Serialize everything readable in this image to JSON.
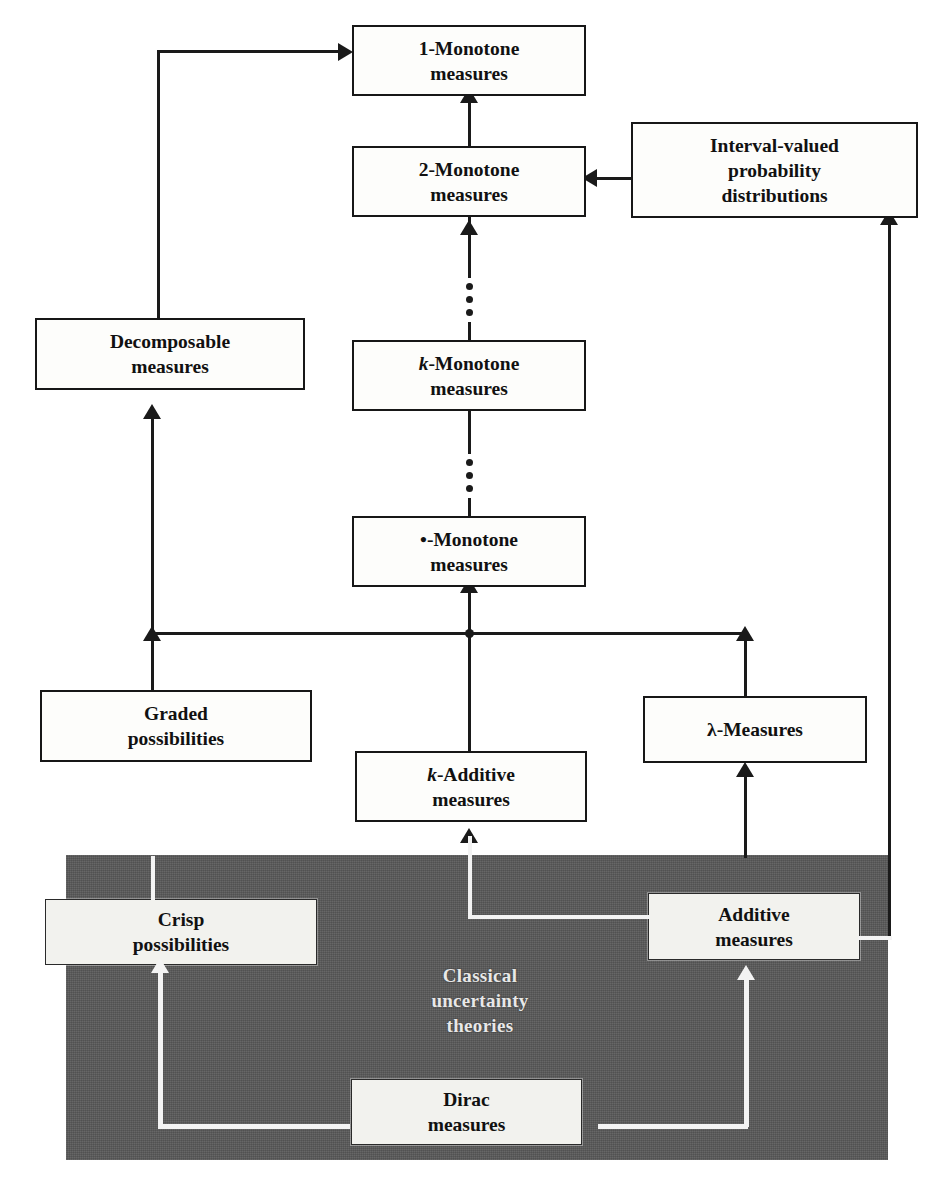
{
  "diagram": {
    "region": {
      "caption_line1": "Classical",
      "caption_line2": "uncertainty",
      "caption_line3": "theories",
      "fill_color": "#595959",
      "text_color": "#e8e8e8"
    },
    "colors": {
      "box_fill": "#fdfdfb",
      "box_border": "#171717",
      "edge": "#1a1a1a",
      "edge_inside_region": "#f3f3f3",
      "page_background": "#ffffff"
    },
    "nodes": [
      {
        "id": "one-monotone",
        "line1": "1-Monotone",
        "line2": "measures",
        "prefix_style": "normal"
      },
      {
        "id": "two-monotone",
        "line1": "2-Monotone",
        "line2": "measures",
        "prefix_style": "normal"
      },
      {
        "id": "interval-valued",
        "line1": "Interval-valued",
        "line2": "probability",
        "line3": "distributions",
        "prefix_style": "normal"
      },
      {
        "id": "decomposable",
        "line1": "Decomposable",
        "line2": "measures",
        "prefix_style": "normal"
      },
      {
        "id": "k-monotone",
        "prefix": "k",
        "line1": "-Monotone",
        "line2": "measures",
        "prefix_style": "italic"
      },
      {
        "id": "inf-monotone",
        "prefix": "•",
        "line1": "-Monotone",
        "line2": "measures",
        "prefix_style": "symbol"
      },
      {
        "id": "graded-possibilities",
        "line1": "Graded",
        "line2": "possibilities",
        "prefix_style": "normal"
      },
      {
        "id": "k-additive",
        "prefix": "k",
        "line1": "-Additive",
        "line2": "measures",
        "prefix_style": "italic"
      },
      {
        "id": "lambda-measures",
        "prefix": "λ",
        "line1": "-Measures",
        "prefix_style": "symbol"
      },
      {
        "id": "crisp-possibilities",
        "line1": "Crisp",
        "line2": "possibilities",
        "prefix_style": "normal"
      },
      {
        "id": "additive",
        "line1": "Additive",
        "line2": "measures",
        "prefix_style": "normal"
      },
      {
        "id": "dirac",
        "line1": "Dirac",
        "line2": "measures",
        "prefix_style": "normal"
      }
    ],
    "edges": [
      {
        "from": "two-monotone",
        "to": "one-monotone",
        "style": "solid-arrow"
      },
      {
        "from": "decomposable",
        "to": "one-monotone",
        "style": "elbow-arrow"
      },
      {
        "from": "interval-valued",
        "to": "two-monotone",
        "style": "solid-arrow"
      },
      {
        "from": "k-monotone",
        "to": "two-monotone",
        "style": "dotted-arrow"
      },
      {
        "from": "inf-monotone",
        "to": "k-monotone",
        "style": "dotted-arrow"
      },
      {
        "from": "bus",
        "to": "inf-monotone",
        "style": "solid-arrow"
      },
      {
        "from": "graded-possibilities",
        "to": "decomposable",
        "style": "solid-arrow"
      },
      {
        "from": "bus",
        "to": "graded-possibilities",
        "style": "solid-arrow"
      },
      {
        "from": "bus",
        "to": "lambda-measures",
        "style": "solid-arrow"
      },
      {
        "from": "k-additive",
        "to": "inf-monotone",
        "style": "solid-arrow"
      },
      {
        "from": "crisp-possibilities",
        "to": "graded-possibilities",
        "style": "solid-arrow"
      },
      {
        "from": "additive",
        "to": "k-additive",
        "style": "solid-arrow"
      },
      {
        "from": "additive",
        "to": "lambda-measures",
        "style": "solid-arrow"
      },
      {
        "from": "additive",
        "to": "interval-valued",
        "style": "long-right-arrow"
      },
      {
        "from": "dirac",
        "to": "crisp-possibilities",
        "style": "white-elbow-arrow"
      },
      {
        "from": "dirac",
        "to": "additive",
        "style": "white-elbow-arrow"
      }
    ]
  }
}
